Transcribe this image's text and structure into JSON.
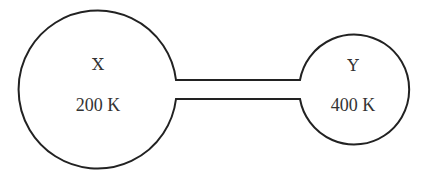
{
  "diagram": {
    "type": "two-bulb-container",
    "stroke_color": "#222222",
    "text_color": "#333333",
    "bulbs": [
      {
        "label": "X",
        "temperature": "200 K",
        "size": "large",
        "position": "left"
      },
      {
        "label": "Y",
        "temperature": "400 K",
        "size": "small",
        "position": "right"
      }
    ],
    "connector": "narrow tube"
  }
}
